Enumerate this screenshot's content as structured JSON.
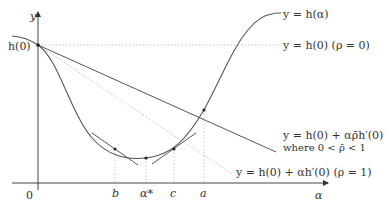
{
  "diagram": {
    "type": "line-search-illustration",
    "axes": {
      "x_label": "α",
      "y_label": "y",
      "origin_label": "0"
    },
    "y_intercept_label": "h(0)",
    "x_ticks": [
      {
        "id": "b",
        "label": "b",
        "x": 115
      },
      {
        "id": "alpha_star",
        "label": "α*",
        "x": 146
      },
      {
        "id": "c",
        "label": "c",
        "x": 174
      },
      {
        "id": "a",
        "label": "a",
        "x": 204
      }
    ],
    "curves": {
      "h": {
        "label": "y = h(α)"
      },
      "rho0": {
        "label": "y = h(0) (ρ = 0)"
      },
      "rhobar": {
        "label_line1": "y = h(0) + αρ̄h′(0)",
        "label_line2": "where 0 < ρ̄ < 1"
      },
      "rho1": {
        "label": "y = h(0) + αh′(0) (ρ = 1)"
      }
    },
    "colors": {
      "curve": "#555555",
      "axis": "#444444",
      "dotted": "#bbbbbb",
      "text": "#333333"
    }
  }
}
